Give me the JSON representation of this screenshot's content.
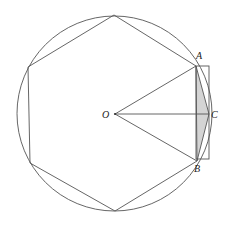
{
  "diagram": {
    "labels": {
      "O": "O",
      "A": "A",
      "B": "B",
      "C": "C"
    },
    "colors": {
      "line": "#555555",
      "shade": "#d4d4d4",
      "text": "#222222"
    }
  }
}
